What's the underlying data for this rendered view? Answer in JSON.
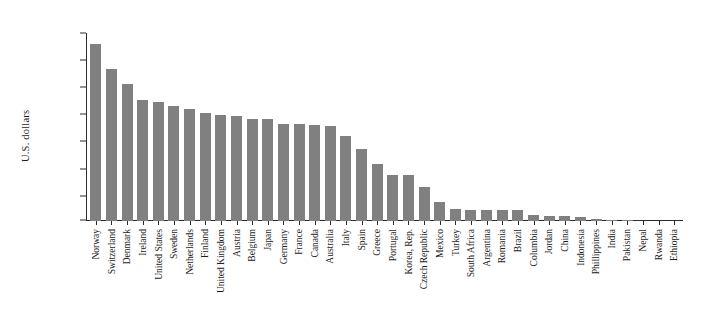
{
  "chart_data": {
    "type": "bar",
    "title": "",
    "subtitle": "",
    "xlabel": "",
    "ylabel": "U.S. dollars",
    "ylim": [
      1000,
      70000
    ],
    "ytick_labels": [
      "$70,000",
      "$60,000",
      "$50,000",
      "$40,000",
      "$30,000",
      "$20,000",
      "$10,000",
      "$1,000"
    ],
    "ytick_values": [
      70000,
      60000,
      50000,
      40000,
      30000,
      20000,
      10000,
      1000
    ],
    "grid": false,
    "legend": null,
    "bar_color": "#808080",
    "axis_color": "#2b2b2b",
    "categories": [
      "Norway",
      "Switzerland",
      "Denmark",
      "Ireland",
      "United States",
      "Sweden",
      "Netherlands",
      "Finland",
      "United Kingdom",
      "Austria",
      "Belgium",
      "Japan",
      "Germany",
      "France",
      "Canada",
      "Australia",
      "Italy",
      "Spain",
      "Greece",
      "Portugal",
      "Korea, Rep.",
      "Czech Republic",
      "Mexico",
      "Turkey",
      "South Africa",
      "Argentina",
      "Romania",
      "Brazil",
      "Columbia",
      "Jordan",
      "China",
      "Indonesia",
      "Phillippines",
      "India",
      "Pakistan",
      "Nepal",
      "Rwanda",
      "Ethiopia"
    ],
    "values": [
      66500,
      57000,
      51500,
      45500,
      45000,
      43500,
      42500,
      40800,
      40300,
      39700,
      38800,
      38500,
      36800,
      36700,
      36400,
      36200,
      32300,
      27600,
      22100,
      18100,
      17800,
      13500,
      8200,
      5500,
      5200,
      5100,
      5000,
      5000,
      3200,
      2900,
      2800,
      2400,
      1900,
      1400,
      1200,
      750,
      550,
      400
    ]
  }
}
